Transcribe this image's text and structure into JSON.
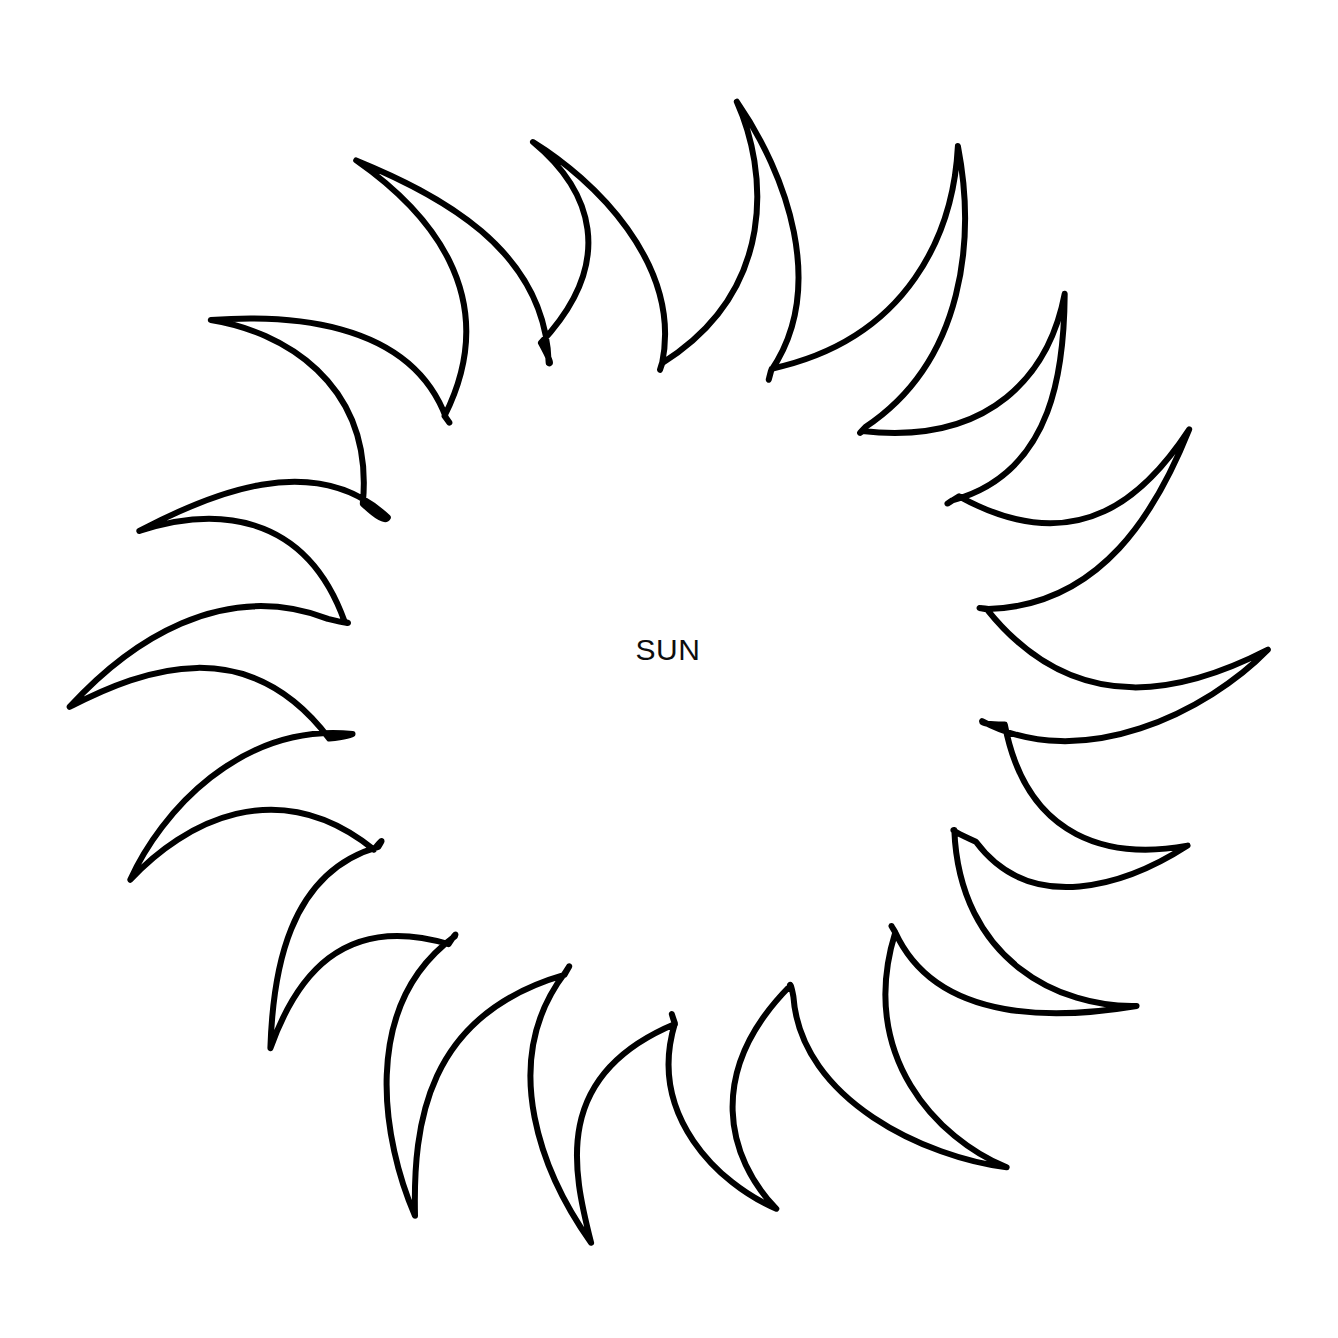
{
  "document": {
    "kind": "line-drawing",
    "subject": "sun",
    "background_color": "#ffffff",
    "stroke_color": "#000000",
    "stroke_width_px": 6,
    "canvas": {
      "width": 1338,
      "height": 1338
    }
  },
  "labels": {
    "center_text": "SUN"
  },
  "figure": {
    "center": {
      "x": 668,
      "y": 672
    },
    "ray_count": 18,
    "inner_radius_px": 330,
    "outer_radius_px": 600,
    "extents": {
      "top_tip": {
        "x": 677,
        "y": 85
      },
      "bottom_tip": {
        "x": 593,
        "y": 1272
      },
      "left_tip": {
        "x": 152,
        "y": 462
      },
      "right_tip": {
        "x": 1272,
        "y": 654
      }
    },
    "ray_tips": [
      {
        "index": 1,
        "x": 677,
        "y": 85
      },
      {
        "index": 2,
        "x": 885,
        "y": 98
      },
      {
        "index": 3,
        "x": 1075,
        "y": 238
      },
      {
        "index": 4,
        "x": 1228,
        "y": 378
      },
      {
        "index": 5,
        "x": 1272,
        "y": 654
      },
      {
        "index": 6,
        "x": 1222,
        "y": 900
      },
      {
        "index": 7,
        "x": 1028,
        "y": 1110
      },
      {
        "index": 8,
        "x": 862,
        "y": 1196
      },
      {
        "index": 9,
        "x": 593,
        "y": 1272
      },
      {
        "index": 10,
        "x": 366,
        "y": 1216
      },
      {
        "index": 11,
        "x": 182,
        "y": 1056
      },
      {
        "index": 12,
        "x": 80,
        "y": 894
      },
      {
        "index": 13,
        "x": 104,
        "y": 686
      },
      {
        "index": 14,
        "x": 152,
        "y": 462
      },
      {
        "index": 15,
        "x": 306,
        "y": 262
      },
      {
        "index": 16,
        "x": 470,
        "y": 106
      },
      {
        "index": 17,
        "x": 1002,
        "y": 148
      },
      {
        "index": 18,
        "x": 912,
        "y": 846
      }
    ]
  },
  "outline_path": "M677.5 85.5 C680.5 103.5 687.5 130.5 693.5 158.5 C700.5 190.5 708.5 223.5 716.5 254.5 C722.5 278.5 726.5 294.5 726.5 304.5 C726.5 312.5 722.5 318.5 716.5 316.5 C710.5 314.5 706.5 304.5 703.5 288.5 C699.5 266.5 694.5 238.5 689.5 216.5 C684.5 194.5 678.5 172.5 672.5 156.5 C667.5 143.5 662.5 137.5 659.5 141.5 C657.5 144.5 657.5 154.5 659.5 172.5 C662.5 197.5 666.5 228.5 670.5 258.5 C674.5 288.5 676.5 308.5 674.5 316.5 C672.5 323.5 667.5 325.5 660.5 318.5 C653.5 311.5 644.5 294.5 633.5 272.5 C618.5 242.5 601.5 209.5 584.5 178.5 C567.5 147.5 552.5 123.5 541.5 110.5 C532.5 99.5 525.5 98.5 522.5 106.5 C519.5 114.5 521.5 129.5 527.5 150.5 C535.5 178.5 546.5 211.5 556.5 242.5 C566.5 273.5 574.5 300.5 578.5 318.5 C581.5 331.5 580.5 339.5 575.5 341.5 C570.5 343.5 563.5 338.5 554.5 327.5 C540.5 310.5 521.5 286.5 500.5 262.5 C475.5 233.5 447.5 203.5 422.5 181.5 C398.5 160.5 378.5 149.5 365.5 149.5 C354.5 149.5 350.5 155.5 353.5 167.5 C356.5 179.5 366.5 196.5 380.5 216.5 C398.5 241.5 421.5 270.5 442.5 298.5 C463.5 326.5 480.5 351.5 489.5 369.5 C496.5 383.5 497.5 393.5 492.5 397.5 C487.5 401.5 477.5 399.5 464.5 391.5 C445.5 379.5 420.5 361.5 394.5 344.5 C360.5 322.5 323.5 301.5 292.5 289.5 C263.5 278.5 243.5 277.5 236.5 286.5 C230.5 294.5 236.5 309.5 252.5 328.5 C272.5 352.5 304.5 379.5 335.5 404.5 C366.5 429.5 395.5 452.5 412.5 470.5 C425.5 484.5 429.5 495.5 424.5 501.5 C419.5 507.5 407.5 507.5 390.5 503.5 C368.5 498.5 340.5 489.5 311.5 481.5 C272.5 470.5 229.5 461.5 194.5 458.5 C164.5 455.5 146.5 459.5 143.5 469.5 C140.5 479.5 152.5 493.5 173.5 508.5 C199.5 527.5 238.5 548.5 275.5 568.5 C312.5 588.5 347.5 607.5 367.5 622.5 C382.5 633.5 388.5 643.5 384.5 650.5 C380.5 657.5 368.5 660.5 350.5 660.5 C327.5 660.5 297.5 657.5 266.5 656.5 C224.5 655.5 179.5 657.5 144.5 664.5 C114.5 670.5 97.5 680.5 97.5 691.5 C97.5 702.5 113.5 712.5 138.5 721.5 C169.5 732.5 212.5 742.5 253.5 752.5 C294.5 762.5 332.5 772.5 355.5 782.5 C372.5 789.5 380.5 797.5 378.5 805.5 C376.5 813.5 365.5 819.5 348.5 825.5 C326.5 833.5 297.5 842.5 267.5 853.5 C227.5 868.5 186.5 887.5 155.5 905.5 C129.5 920.5 116.5 934.5 119.5 944.5 C122.5 954.5 141.5 958.5 168.5 957.5 C202.5 956.5 246.5 949.5 289.5 943.5 C332.5 937.5 371.5 932.5 395.5 935.5 C413.5 937.5 423.5 943.5 424.5 951.5 C425.5 959.5 417.5 969.5 403.5 980.5 C385.5 994.5 360.5 1010.5 335.5 1028.5 C302.5 1052.5 268.5 1079.5 243.5 1104.5 C222.5 1125.5 213.5 1142.5 219.5 1150.5 C225.5 1158.5 245.5 1156.5 271.5 1147.5 C304.5 1136.5 344.5 1116.5 383.5 1096.5 C422.5 1076.5 457.5 1057.5 479.5 1050.5 C496.5 1045.5 507.5 1047.5 511.5 1054.5 C515.5 1061.5 511.5 1073.5 502.5 1088.5 C490.5 1108.5 472.5 1132.5 455.5 1158.5 C433.5 1191.5 412.5 1226.5 400.5 1254.5 C390.5 1277.5 390.5 1292.5 398.5 1295.5 C406.5 1298.5 421.5 1288.5 438.5 1270.5 C460.5 1247.5 486.5 1213.5 511.5 1180.5 C536.5 1147.5 558.5 1117.5 574.5 1100.5 C586.5 1087.5 596.5 1083.5 602.5 1089.5 C608.5 1095.5 610.5 1108.5 610.5 1126.5 C610.5 1149.5 608.5 1178.5 607.5 1206.5 C606.5 1232.5 606.5 1252.5 610.5 1263.5 C613.5 1271.5 619.5 1273.5 625.5 1266.5 C632.5 1258.5 640.5 1241.5 650.5 1219.5 C663.5 1190.5 678.5 1156.5 692.5 1127.5 C706.5 1098.5 719.5 1076.5 730.5 1065.5 C739.5 1056.5 747.5 1056.5 752.5 1064.5 C757.5 1072.5 759.5 1087.5 761.5 1106.5 C764.5 1131.5 767.5 1161.5 772.5 1188.5 C777.5 1214.5 784.5 1234.5 792.5 1241.5 C799.5 1247.5 806.5 1241.5 813.5 1226.5 C822.5 1207.5 832.5 1177.5 843.5 1146.5 C854.5 1115.5 865.5 1084.5 876.5 1062.5 C885.5 1044.5 894.5 1036.5 901.5 1040.5 C908.5 1044.5 912.5 1058.5 915.5 1077.5 C919.5 1102.5 922.5 1134.5 927.5 1162.5 C932.5 1190.5 939.5 1211.5 948.5 1216.5 C956.5 1220.5 964.5 1211.5 973.5 1194.5 C985.5 1172.5 999.5 1140.5 1012.5 1110.5 C1030.5 1070.5 1047.5 1031.5 1058.5 1003.5 C1066.5 982.5 1067.5 969.5 1061.5 966.5 C1055.5 963.5 1043.5 970.5 1028.5 982.5 C1008.5 998.5 982.5 1021.5 957.5 1041.5 C932.5 1061.5 911.5 1075.5 897.5 1077.5 C886.5 1079.5 880.5 1073.5 879.5 1061.5 C878.5 1049.5 883.5 1032.5 891.5 1012.5 C902.5 986.5 918.5 953.5 932.5 922.5 C946.5 891.5 957.5 865.5 961.5 847.5 C964.5 834.5 962.5 826.5 955.5 825.5 C948.5 824.5 938.5 830.5 926.5 841.5 C909.5 856.5 889.5 877.5 869.5 896.5 C849.5 915.5 832.5 930.5 820.5 936.5 C810.5 941.5 803.5 939.5 801.5 930.5 C799.5 921.5 802.5 906.5 808.5 888.5 C816.5 864.5 829.5 834.5 841.5 805.5 C853.5 776.5 863.5 751.5 868.5 734.5 C872.5 721.5 871.5 713.5 865.5 712.5 C859.5 711.5 849.5 717.5 837.5 727.5 C821.5 740.5 801.5 759.5 781.5 777.5 C761.5 795.5 744.5 810.5 732.5 817.5 C722.5 823.5 715.5 822.5 712.5 814.5 C709.5 806.5 710.5 791.5 714.5 773.5 C719.5 751.5 728.5 723.5 736.5 695.5 C744.5 667.5 750.5 643.5 752.5 626.5 C754.5 612.5 752.5 604.5 746.5 603.5 C740.5 602.5 731.5 608.5 720.5 618.5 C705.5 631.5 687.5 650.5 669.5 667.5 C651.5 684.5 636.5 698.5 625.5 704.5 C616.5 709.5 609.5 707.5 606.5 699.5 C603.5 691.5 604.5 676.5 607.5 658.5 C611.5 636.5 619.5 608.5 626.5 580.5 C633.5 552.5 638.5 528.5 640.5 511.5 C642.5 497.5 640.5 489.5 635.5 488.5 C630.5 487.5 622.5 493.5 612.5 503.5 C599.5 516.5 583.5 535.5 567.5 552.5 C551.5 569.5 538.5 583.5 528.5 589.5 C520.5 594.5 513.5 592.5 511.5 584.5 C509.5 576.5 510.5 561.5 514.5 543.5 C519.5 521.5 527.5 493.5 534.5 465.5 C541.5 437.5 546.5 413.5 548.5 396.5 C550.5 382.5 548.5 374.5 543.5 373.5 C538.5 372.5 530.5 378.5 520.5 388.5 C507.5 401.5 491.5 420.5 475.5 437.5 C459.5 454.5 446.5 468.5 436.5 474.5 C428.5 479.5 421.5 477.5 419.5 469.5 C417.5 461.5 418.5 446.5 422.5 428.5 Z",
  "outline_path_simple": "sun-outline"
}
